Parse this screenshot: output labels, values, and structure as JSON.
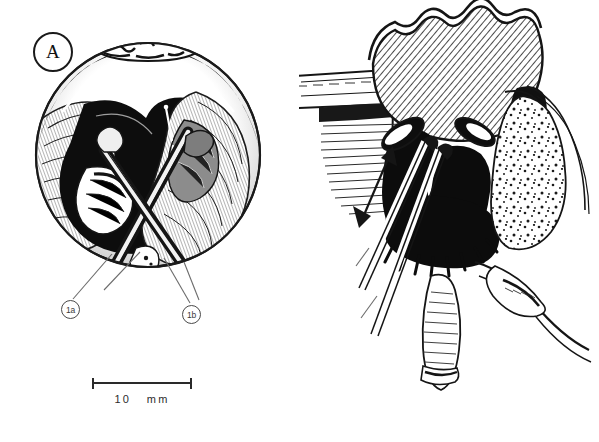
{
  "figure": {
    "type": "medical-surgical-illustration",
    "style": "pen-and-ink halftone line drawing, black on white",
    "background_color": "#ffffff",
    "ink_color": "#151515",
    "width_px": 599,
    "height_px": 442
  },
  "panels": [
    {
      "id": "A",
      "marker_label": "A",
      "marker_position": "top-left",
      "view": "circular surgical field / operative exposure seen through a round aperture",
      "description": "Round inset showing an opened operative field with retracted soft-tissue flaps, a dark cavity at the centre, and two elongated surgical instruments entering from below and crossing one another.",
      "instruments": [
        {
          "label": "1a",
          "leader_from": "instrument shaft entering lower-left of the round field"
        },
        {
          "label": "1b",
          "leader_from": "instrument shaft entering lower-right of the round field"
        }
      ],
      "scale": {
        "length_label": "10",
        "unit_label": "mm",
        "full_label": "10  mm"
      }
    },
    {
      "id": "A'",
      "marker_label": "A'",
      "marker_position": "top-right",
      "view": "coronal cross-section through the nasal cavity and paranasal sinus region",
      "description": "Sectional anatomical drawing: cross-hatched bone (nasal septum / turbinate mass) above, solid black airway spaces, stippled cancellous bone at the right, laminated soft tissue at the left, and two instrument shafts passing upward into the cavity. A double-headed arrow indicates the direction of instrument excursion.",
      "instruments": [
        {
          "label": "2a",
          "leader_from": "upper instrument shaft entering from lower-left"
        },
        {
          "label": "2b",
          "leader_from": "lower instrument shaft entering from lower-left"
        }
      ],
      "annotations": [
        {
          "type": "double-headed-arrow",
          "meaning": "range of instrument movement"
        }
      ],
      "scale": {
        "length_label": "10",
        "unit_label": "mm",
        "full_label": "10  mm"
      }
    }
  ],
  "labels": {
    "panel_a": "A",
    "panel_aprime": "A'",
    "instrument_1a": "1a",
    "instrument_1b": "1b",
    "instrument_2a": "2a",
    "instrument_2b": "2b"
  },
  "scale_bars": {
    "left": "10   mm",
    "right": "10  mm"
  }
}
